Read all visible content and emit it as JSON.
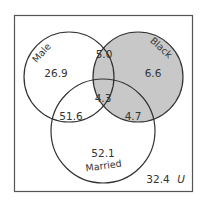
{
  "diagram": {
    "type": "venn-3",
    "universe": {
      "label": "U",
      "value": "32.4"
    },
    "sets": [
      {
        "name": "Male",
        "label": "Male",
        "shaded": false
      },
      {
        "name": "Black",
        "label": "Black",
        "shaded": true
      },
      {
        "name": "Married",
        "label": "Married",
        "shaded": false
      }
    ],
    "regions": {
      "male_only": "26.9",
      "black_only": "6.6",
      "married_only": "52.1",
      "male_black": "5.0",
      "male_married": "51.6",
      "black_married": "4.7",
      "all_three": "4.3"
    },
    "colors": {
      "shade": "#c8c8c8",
      "stroke": "#333333",
      "border": "#555555",
      "background": "#ffffff"
    }
  }
}
